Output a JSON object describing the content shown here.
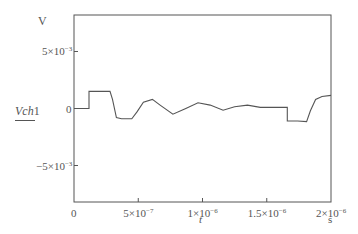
{
  "chart_data": {
    "type": "line",
    "title": "",
    "xlabel": "t",
    "xunit": "s",
    "ylabel": "Vch1",
    "yunit": "V",
    "xlim": [
      0,
      2e-06
    ],
    "ylim": [
      -0.0082,
      0.0082
    ],
    "grid": false,
    "legend": null,
    "x_ticks": [
      {
        "value": 0,
        "label": "0"
      },
      {
        "value": 5e-07,
        "label": "5×10",
        "exp": "−7"
      },
      {
        "value": 1e-06,
        "label": "1×10",
        "exp": "−6"
      },
      {
        "value": 1.5e-06,
        "label": "1.5×10",
        "exp": "−6"
      },
      {
        "value": 2e-06,
        "label": "2×10",
        "exp": "−6"
      }
    ],
    "y_ticks": [
      {
        "value": 0.005,
        "label": "5×10",
        "exp": "−3"
      },
      {
        "value": 0,
        "label": "0",
        "exp": ""
      },
      {
        "value": -0.005,
        "label": "−5×10",
        "exp": "−3"
      }
    ],
    "series": [
      {
        "name": "Vch1",
        "color": "#555555",
        "x": [
          0,
          1.17e-07,
          1.17e-07,
          2.8e-07,
          3e-07,
          3.3e-07,
          3.7e-07,
          4.5e-07,
          4.9e-07,
          5.4e-07,
          6.1e-07,
          6.7e-07,
          7.7e-07,
          8.7e-07,
          9.65e-07,
          1.06e-06,
          1.16e-06,
          1.25e-06,
          1.35e-06,
          1.45e-06,
          1.66e-06,
          1.66e-06,
          1.74e-06,
          1.81e-06,
          1.84e-06,
          1.88e-06,
          1.93e-06,
          2e-06
        ],
        "y": [
          0,
          0,
          0.0015,
          0.0015,
          0.0008,
          -0.0008,
          -0.0009,
          -0.0009,
          -0.0003,
          0.00055,
          0.0008,
          0.0003,
          -0.0005,
          0,
          0.0005,
          0.0003,
          -0.00015,
          0.00015,
          0.0003,
          0.0001,
          0.0001,
          -0.0011,
          -0.0011,
          -0.00115,
          -0.0002,
          0.0008,
          0.00105,
          0.00115
        ]
      }
    ]
  },
  "labels": {
    "y_unit": "V",
    "y_name_italic": "Vch",
    "y_name_num": "1",
    "x_name": "t",
    "x_unit": "s"
  }
}
